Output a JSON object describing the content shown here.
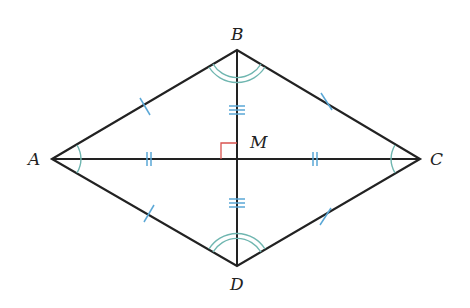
{
  "diagram": {
    "type": "rhombus-with-diagonals",
    "vertices": {
      "A": {
        "label": "A",
        "x": 52,
        "y": 159
      },
      "B": {
        "label": "B",
        "x": 237,
        "y": 50
      },
      "C": {
        "label": "C",
        "x": 420,
        "y": 159
      },
      "D": {
        "label": "D",
        "x": 237,
        "y": 266
      }
    },
    "intersection": {
      "label": "M",
      "x": 237,
      "y": 159
    },
    "right_angle_at": "M",
    "marks": {
      "sides": "single tick on each of AB, BC, CD, DA",
      "half_diagonal_AC": "double tick on AM and MC",
      "half_diagonal_BD": "triple tick on BM and MD",
      "angles_A_C": "single arc at A and C on both halves",
      "angles_B_D": "double arc at B and D on both halves"
    },
    "colors": {
      "line": "#222222",
      "tick": "#5aa7d6",
      "arc": "#6fb6b0",
      "right_angle": "#d9534f"
    }
  }
}
